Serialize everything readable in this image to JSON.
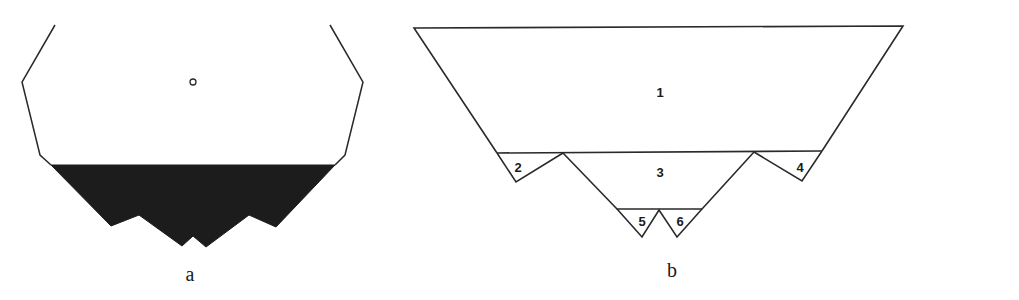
{
  "figure_a": {
    "caption": "a",
    "outline_color": "#2a2a2a",
    "fill_color": "#1c1c1c",
    "has_center_marker": true
  },
  "figure_b": {
    "caption": "b",
    "outline_color": "#2a2a2a",
    "regions": [
      {
        "id": "region-1",
        "label": "1"
      },
      {
        "id": "region-2",
        "label": "2"
      },
      {
        "id": "region-3",
        "label": "3"
      },
      {
        "id": "region-4",
        "label": "4"
      },
      {
        "id": "region-5",
        "label": "5"
      },
      {
        "id": "region-6",
        "label": "6"
      }
    ]
  }
}
